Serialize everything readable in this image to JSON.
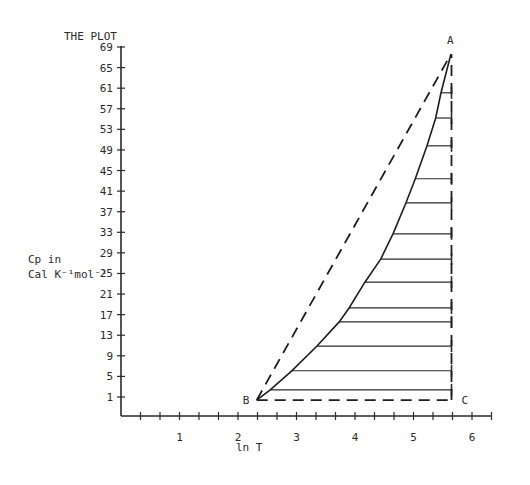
{
  "chart_data": {
    "type": "line",
    "title": "THE PLOT",
    "xlabel": "ln T",
    "ylabel_line1": "Cp in",
    "ylabel_line2": "Cal K⁻¹mol⁻¹",
    "xlim": [
      0,
      6.3
    ],
    "ylim": [
      -3,
      69
    ],
    "x_ticks": [
      1,
      2,
      3,
      4,
      5,
      6
    ],
    "x_minor_ticks_per_unit": 3,
    "y_ticks": [
      1,
      5,
      9,
      13,
      17,
      21,
      25,
      29,
      33,
      37,
      41,
      45,
      49,
      53,
      57,
      61,
      65,
      69
    ],
    "grid": false,
    "points": {
      "A": {
        "label": "A",
        "x": 5.64,
        "y": 67.6
      },
      "B": {
        "label": "B",
        "x": 2.32,
        "y": 0.4
      },
      "C": {
        "label": "C",
        "x": 5.65,
        "y": 0.4
      }
    },
    "series": [
      {
        "name": "Cp curve",
        "style": "solid",
        "x": [
          2.32,
          2.55,
          2.92,
          3.35,
          3.73,
          3.9,
          4.17,
          4.44,
          4.65,
          4.87,
          5.03,
          5.23,
          5.38,
          5.47,
          5.64
        ],
        "y": [
          0.4,
          2.4,
          6.1,
          10.9,
          15.6,
          18.3,
          23.3,
          27.8,
          32.7,
          38.7,
          43.4,
          49.8,
          55.2,
          60.1,
          67.6
        ]
      },
      {
        "name": "B-A chord",
        "style": "dashed",
        "x": [
          2.32,
          5.64
        ],
        "y": [
          0.4,
          67.6
        ]
      },
      {
        "name": "B-C baseline",
        "style": "dashed",
        "x": [
          2.32,
          5.65
        ],
        "y": [
          0.4,
          0.4
        ]
      },
      {
        "name": "C-A vertical",
        "style": "dashed",
        "x": [
          5.65,
          5.65
        ],
        "y": [
          0.4,
          67.6
        ]
      }
    ],
    "hatch_lines": [
      {
        "y": 2.4,
        "x_start": 2.55,
        "x_end": 5.65
      },
      {
        "y": 6.1,
        "x_start": 2.92,
        "x_end": 5.65
      },
      {
        "y": 10.9,
        "x_start": 3.35,
        "x_end": 5.65
      },
      {
        "y": 15.6,
        "x_start": 3.73,
        "x_end": 5.65
      },
      {
        "y": 18.3,
        "x_start": 3.9,
        "x_end": 5.65
      },
      {
        "y": 23.3,
        "x_start": 4.17,
        "x_end": 5.65
      },
      {
        "y": 27.8,
        "x_start": 4.44,
        "x_end": 5.65
      },
      {
        "y": 32.7,
        "x_start": 4.65,
        "x_end": 5.65
      },
      {
        "y": 38.7,
        "x_start": 4.87,
        "x_end": 5.65
      },
      {
        "y": 43.4,
        "x_start": 5.03,
        "x_end": 5.65
      },
      {
        "y": 49.8,
        "x_start": 5.23,
        "x_end": 5.65
      },
      {
        "y": 55.2,
        "x_start": 5.38,
        "x_end": 5.65
      },
      {
        "y": 60.1,
        "x_start": 5.47,
        "x_end": 5.65
      }
    ],
    "colors": {
      "ink": "#1e1e1e",
      "background": "#ffffff"
    }
  }
}
